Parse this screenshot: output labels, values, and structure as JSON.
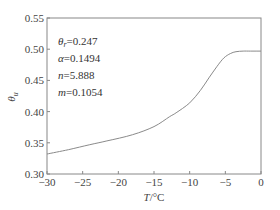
{
  "chart_data": {
    "type": "line",
    "title": "",
    "xlabel": "T/°C",
    "xlabel_var": "T",
    "xlabel_unit": "/°C",
    "ylabel": "θu",
    "ylabel_var": "θ",
    "ylabel_sub": "u",
    "xlim": [
      -30,
      0
    ],
    "ylim": [
      0.3,
      0.55
    ],
    "xticks": [
      -30,
      -25,
      -20,
      -15,
      -10,
      -5,
      0
    ],
    "xtick_labels": [
      "−30",
      "−25",
      "−20",
      "−15",
      "−10",
      "−5",
      "0"
    ],
    "yticks": [
      0.3,
      0.35,
      0.4,
      0.45,
      0.5,
      0.55
    ],
    "ytick_labels": [
      "0.30",
      "0.35",
      "0.40",
      "0.45",
      "0.50",
      "0.55"
    ],
    "grid": false,
    "legend": null,
    "series": [
      {
        "name": "θu",
        "color": "#8a8a8a",
        "x": [
          -30,
          -27,
          -24,
          -21.6,
          -18,
          -15,
          -12.8,
          -11.9,
          -10,
          -8.5,
          -7.3,
          -6.2,
          -5.2,
          -4.3,
          -3.5,
          -2.5,
          -1.5,
          0
        ],
        "y": [
          0.332,
          0.339,
          0.347,
          0.353,
          0.363,
          0.376,
          0.392,
          0.398,
          0.414,
          0.434,
          0.454,
          0.472,
          0.486,
          0.493,
          0.496,
          0.497,
          0.497,
          0.497
        ]
      }
    ],
    "annotations": [
      {
        "var": "θ",
        "sub": "r",
        "text": "=0.247"
      },
      {
        "var": "α",
        "sub": "",
        "text": "=0.1494"
      },
      {
        "var": "n",
        "sub": "",
        "text": "=5.888"
      },
      {
        "var": "m",
        "sub": "",
        "text": "=0.1054"
      }
    ]
  }
}
